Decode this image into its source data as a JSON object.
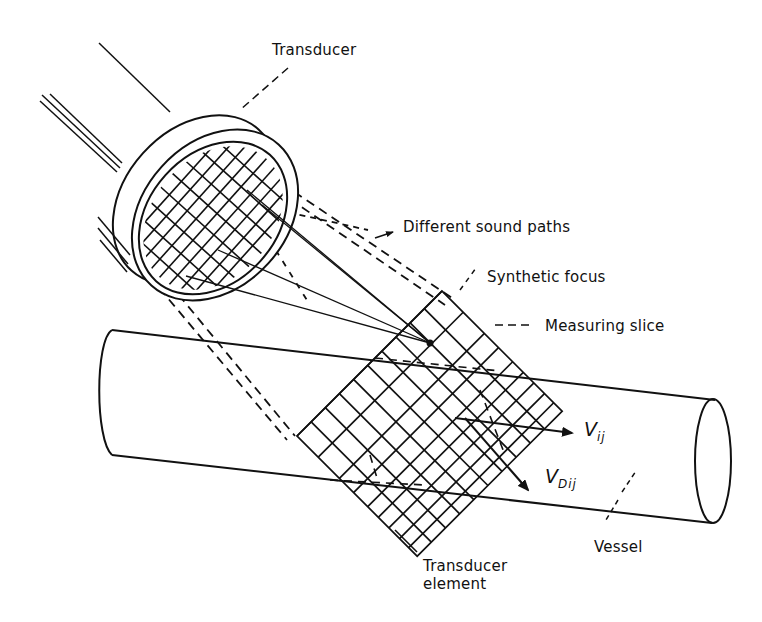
{
  "diagram": {
    "type": "ultrasound-doppler-schematic",
    "colors": {
      "line": "#111111",
      "background": "#ffffff"
    },
    "labels": {
      "transducer": "Transducer",
      "different_sound_paths": "Different sound paths",
      "synthetic_focus": "Synthetic focus",
      "measuring_slice": "Measuring slice",
      "v_ij_main": "V",
      "v_ij_sub": "ij",
      "v_dij_main": "V",
      "v_dij_sub": "Dij",
      "vessel": "Vessel",
      "transducer_element": "Transducer\nelement"
    },
    "components": [
      {
        "id": "transducer",
        "label": "Transducer",
        "shape": "disc with element grid"
      },
      {
        "id": "sound-paths",
        "label": "Different sound paths",
        "shape": "converging lines"
      },
      {
        "id": "synthetic-focus",
        "label": "Synthetic focus",
        "shape": "point"
      },
      {
        "id": "measuring-slice",
        "label": "Measuring slice",
        "shape": "grid plane"
      },
      {
        "id": "vessel",
        "label": "Vessel",
        "shape": "cylinder"
      },
      {
        "id": "velocity-vij",
        "label": "Vij",
        "shape": "arrow"
      },
      {
        "id": "velocity-vdij",
        "label": "VDij",
        "shape": "arrow"
      },
      {
        "id": "transducer-element",
        "label": "Transducer element",
        "shape": "grid cell"
      }
    ]
  }
}
